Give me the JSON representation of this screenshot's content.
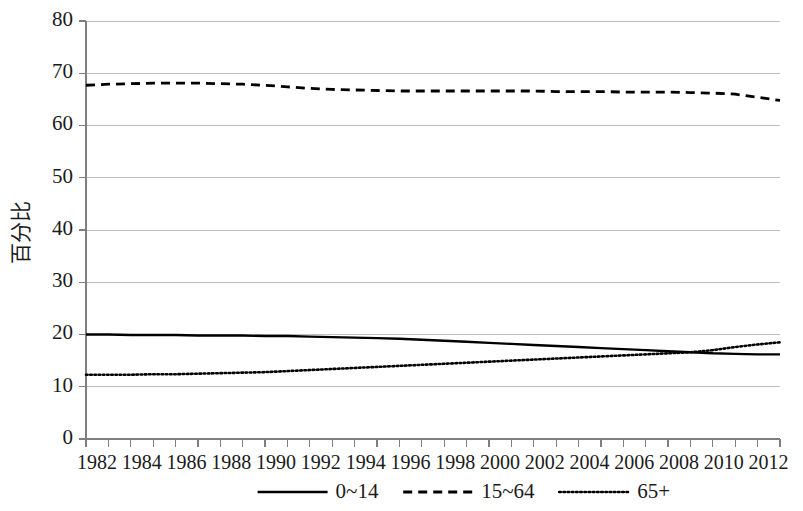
{
  "chart_data": {
    "type": "line",
    "title": "",
    "xlabel": "",
    "ylabel": "百分比",
    "xlim": [
      1982,
      2013
    ],
    "ylim": [
      0,
      80
    ],
    "grid": true,
    "legend_position": "bottom",
    "x": [
      1982,
      1983,
      1984,
      1985,
      1986,
      1987,
      1988,
      1989,
      1990,
      1991,
      1992,
      1993,
      1994,
      1995,
      1996,
      1997,
      1998,
      1999,
      2000,
      2001,
      2002,
      2003,
      2004,
      2005,
      2006,
      2007,
      2008,
      2009,
      2010,
      2011,
      2012,
      2013
    ],
    "xtick_labels": [
      "1982",
      "1984",
      "1986",
      "1988",
      "1990",
      "1992",
      "1994",
      "1996",
      "1998",
      "2000",
      "2002",
      "2004",
      "2006",
      "2008",
      "2010",
      "2012"
    ],
    "ytick_labels": [
      "0",
      "10",
      "20",
      "30",
      "40",
      "50",
      "60",
      "70",
      "80"
    ],
    "ytick_values": [
      0,
      10,
      20,
      30,
      40,
      50,
      60,
      70,
      80
    ],
    "series": [
      {
        "name": "0~14",
        "style": "solid",
        "color": "#000000",
        "values": [
          20.0,
          20.0,
          19.9,
          19.9,
          19.9,
          19.8,
          19.8,
          19.8,
          19.7,
          19.7,
          19.6,
          19.5,
          19.4,
          19.3,
          19.2,
          19.0,
          18.8,
          18.6,
          18.4,
          18.2,
          18.0,
          17.8,
          17.6,
          17.4,
          17.2,
          17.0,
          16.8,
          16.6,
          16.4,
          16.3,
          16.2,
          16.2
        ]
      },
      {
        "name": "15~64",
        "style": "dashed",
        "color": "#000000",
        "values": [
          67.7,
          67.9,
          68.0,
          68.1,
          68.1,
          68.1,
          68.0,
          67.9,
          67.7,
          67.4,
          67.1,
          66.9,
          66.8,
          66.7,
          66.6,
          66.6,
          66.6,
          66.6,
          66.6,
          66.6,
          66.6,
          66.5,
          66.5,
          66.5,
          66.4,
          66.4,
          66.4,
          66.3,
          66.2,
          66.0,
          65.4,
          64.8
        ]
      },
      {
        "name": "65+",
        "style": "dotted",
        "color": "#000000",
        "values": [
          12.3,
          12.3,
          12.3,
          12.4,
          12.4,
          12.5,
          12.6,
          12.7,
          12.8,
          13.0,
          13.2,
          13.4,
          13.6,
          13.8,
          14.0,
          14.2,
          14.4,
          14.6,
          14.8,
          15.0,
          15.2,
          15.4,
          15.6,
          15.8,
          16.0,
          16.2,
          16.4,
          16.6,
          17.0,
          17.6,
          18.1,
          18.5
        ]
      }
    ]
  },
  "legend": {
    "items": [
      {
        "label": "0~14",
        "style": "solid"
      },
      {
        "label": "15~64",
        "style": "dashed"
      },
      {
        "label": "65+",
        "style": "dotted"
      }
    ]
  }
}
